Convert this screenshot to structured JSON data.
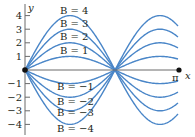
{
  "chart_data": {
    "type": "line",
    "title": "",
    "xlabel": "x",
    "ylabel": "y",
    "x_tick_labels": [
      "π"
    ],
    "y_ticks": [
      4,
      3,
      2,
      1,
      -1,
      -2,
      -3,
      -4
    ],
    "ylim": [
      -4.3,
      4.6
    ],
    "xlim": [
      0,
      3.4
    ],
    "grid": false,
    "legend": "inline labels",
    "series": [
      {
        "name": "B = 4",
        "amplitude": 4
      },
      {
        "name": "B = 3",
        "amplitude": 3
      },
      {
        "name": "B = 2",
        "amplitude": 2
      },
      {
        "name": "B = 1",
        "amplitude": 1
      },
      {
        "name": "B = −1",
        "amplitude": -1
      },
      {
        "name": "B = −2",
        "amplitude": -2
      },
      {
        "name": "B = −3",
        "amplitude": -3
      },
      {
        "name": "B = −4",
        "amplitude": -4
      }
    ],
    "points": [
      {
        "label": "origin",
        "x": 0,
        "y": 0
      },
      {
        "label": "π",
        "x": 3.1416,
        "y": 0
      }
    ],
    "curve_color": "#4a86c8"
  },
  "labels": {
    "y_axis": "y",
    "x_axis": "x",
    "pi": "π",
    "ticks": [
      "4",
      "3",
      "2",
      "1",
      "−1",
      "−2",
      "−3",
      "−4"
    ],
    "curves_pos": [
      "B = 4",
      "B = 3",
      "B = 2",
      "B = 1"
    ],
    "curves_neg": [
      "B = −1",
      "B = −2",
      "B = −3",
      "B = −4"
    ]
  }
}
